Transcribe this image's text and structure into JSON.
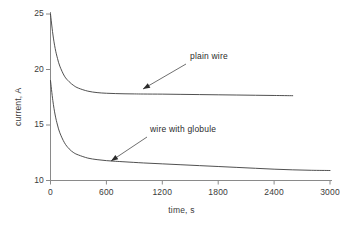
{
  "chart_data": {
    "type": "line",
    "title": "",
    "xlabel": "time, s",
    "ylabel": "current, A",
    "xlim": [
      0,
      3000
    ],
    "ylim": [
      10,
      25
    ],
    "xticks": [
      0,
      600,
      1200,
      1800,
      2400,
      3000
    ],
    "yticks": [
      10,
      15,
      20,
      25
    ],
    "xtick_labels": [
      "0",
      "600",
      "1200",
      "1800",
      "2400",
      "3000"
    ],
    "ytick_labels": [
      "10",
      "15",
      "20",
      "25"
    ],
    "grid": false,
    "legend": "none",
    "line_color": "#3c3c3c",
    "axis_color": "#8a8a8a",
    "series": [
      {
        "name": "plain wire",
        "x": [
          0,
          25,
          50,
          75,
          100,
          150,
          200,
          250,
          300,
          400,
          500,
          600,
          700,
          800,
          900,
          1000,
          1200,
          1400,
          1600,
          1800,
          2000,
          2200,
          2400,
          2600
        ],
        "values": [
          25.0,
          23.2,
          21.9,
          21.0,
          20.3,
          19.4,
          18.9,
          18.55,
          18.32,
          18.05,
          17.92,
          17.86,
          17.83,
          17.81,
          17.8,
          17.79,
          17.78,
          17.76,
          17.74,
          17.72,
          17.7,
          17.68,
          17.66,
          17.64
        ]
      },
      {
        "name": "wire with globule",
        "x": [
          0,
          25,
          50,
          75,
          100,
          150,
          200,
          250,
          300,
          400,
          500,
          600,
          700,
          800,
          1000,
          1200,
          1400,
          1600,
          1800,
          2000,
          2200,
          2400,
          2600,
          2800,
          3000
        ],
        "values": [
          19.0,
          17.2,
          15.9,
          15.0,
          14.3,
          13.4,
          12.85,
          12.5,
          12.3,
          12.02,
          11.88,
          11.79,
          11.73,
          11.68,
          11.58,
          11.5,
          11.42,
          11.34,
          11.26,
          11.18,
          11.1,
          11.02,
          10.96,
          10.92,
          10.9
        ]
      }
    ],
    "annotations": [
      {
        "text": "plain wire",
        "label_x": 190,
        "label_y": 57,
        "arrow_tail_x": 186,
        "arrow_tail_y": 64,
        "arrow_head_x": 143,
        "arrow_head_y": 89
      },
      {
        "text": "wire with globule",
        "label_x": 150,
        "label_y": 130,
        "arrow_tail_x": 147,
        "arrow_tail_y": 137,
        "arrow_head_x": 111,
        "arrow_head_y": 161
      }
    ]
  }
}
